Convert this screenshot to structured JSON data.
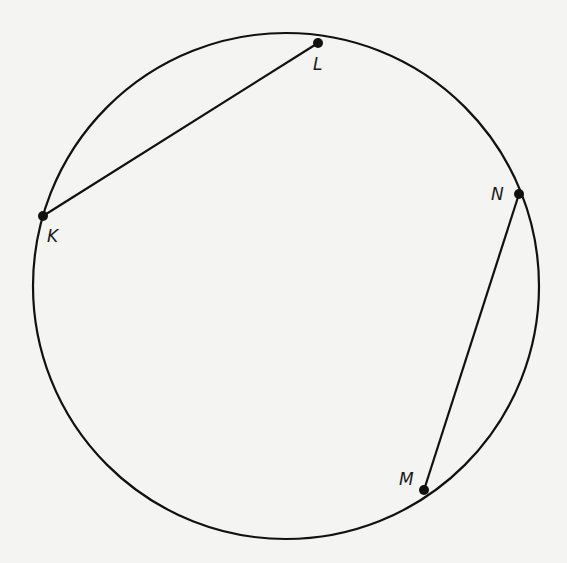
{
  "diagram": {
    "type": "circle-with-chords",
    "background": "#f4f4f2",
    "stroke_color": "#111111",
    "circle": {
      "cx": 286,
      "cy": 286,
      "r": 253
    },
    "points": [
      {
        "id": "L",
        "label": "L",
        "x": 318,
        "y": 43,
        "lx": 313,
        "ly": 70
      },
      {
        "id": "K",
        "label": "K",
        "x": 43,
        "y": 216,
        "lx": 47,
        "ly": 242
      },
      {
        "id": "N",
        "label": "N",
        "x": 519,
        "y": 194,
        "lx": 491,
        "ly": 200
      },
      {
        "id": "M",
        "label": "M",
        "x": 424,
        "y": 490,
        "lx": 399,
        "ly": 485
      }
    ],
    "chords": [
      {
        "from": "K",
        "to": "L"
      },
      {
        "from": "N",
        "to": "M"
      }
    ]
  }
}
